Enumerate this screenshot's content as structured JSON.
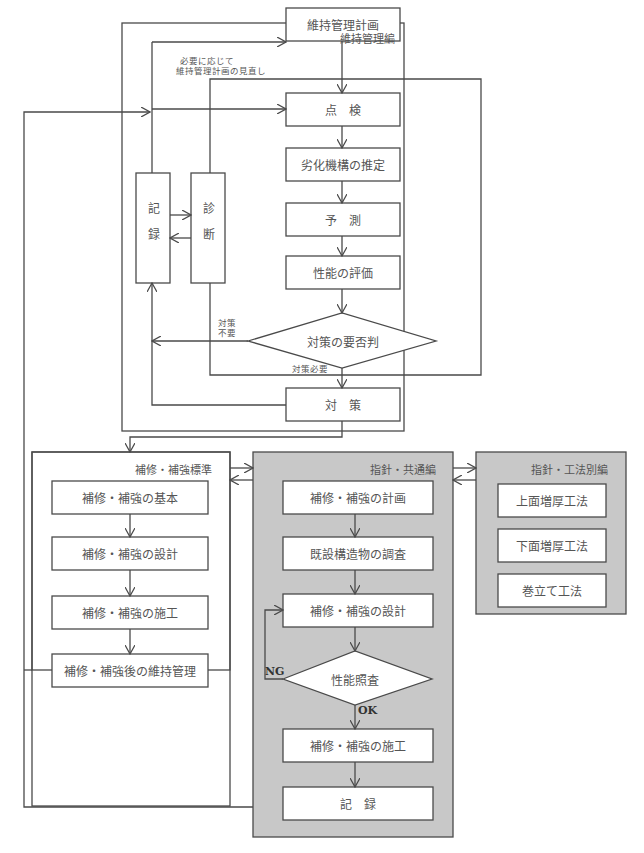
{
  "sections": {
    "maintenance": {
      "title": "維持管理編",
      "boxes": {
        "plan": "維持管理計画",
        "inspection": "点　検",
        "mechanism": "劣化機構の推定",
        "prediction": "予　測",
        "evaluation": "性能の評価",
        "decision": "対策の要否判",
        "countermeasure": "対　策",
        "record": "記録",
        "diagnosis": "診断"
      },
      "notes": {
        "review_line1": "必要に応じて",
        "review_line2": "維持管理計画の見直し",
        "not_needed_line1": "対策",
        "not_needed_line2": "不要",
        "needed": "対策必要"
      }
    },
    "standard": {
      "title": "補修・補強標準",
      "boxes": [
        "補修・補強の基本",
        "補修・補強の設計",
        "補修・補強の施工",
        "補修・補強後の維持管理"
      ]
    },
    "common": {
      "title": "指針・共通編",
      "boxes": {
        "plan": "補修・補強の計画",
        "survey": "既設構造物の調査",
        "design": "補修・補強の設計",
        "check": "性能照査",
        "construction": "補修・補強の施工",
        "record": "記　録"
      },
      "ng": "NG",
      "ok": "OK"
    },
    "methods": {
      "title": "指針・工法別編",
      "boxes": [
        "上面増厚工法",
        "下面増厚工法",
        "巻立て工法"
      ]
    }
  },
  "colors": {
    "line": "#4a4a4a",
    "panel_gray": "#c8c8c8",
    "box_fill": "#ffffff"
  }
}
